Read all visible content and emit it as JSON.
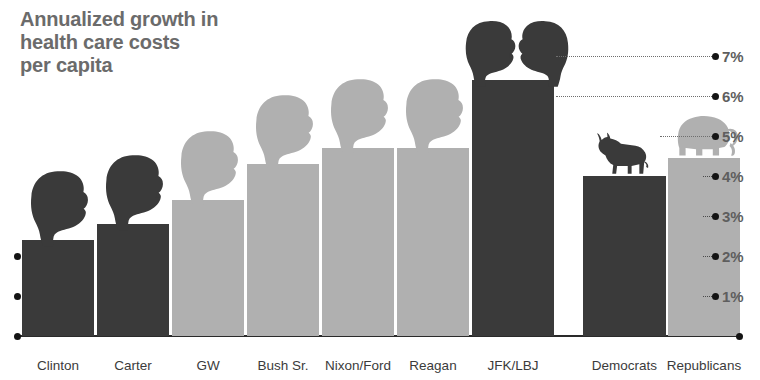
{
  "title": "Annualized growth in\nhealth care costs\nper capita",
  "colors": {
    "dark_bar": "#3a3a3a",
    "light_bar": "#b0b0b0",
    "title_text": "#6b6b6b",
    "axis": "#141414",
    "label_text": "#3b3b3b",
    "tick_text": "#5e5e5e"
  },
  "axis": {
    "tick_labels": [
      "1%",
      "2%",
      "3%",
      "4%",
      "5%",
      "6%",
      "7%"
    ],
    "tick_values": [
      1,
      2,
      3,
      4,
      5,
      6,
      7
    ],
    "left_tick_labels": [
      "",
      "",
      ""
    ],
    "position": "right"
  },
  "icons": {
    "democrat": "donkey-icon",
    "republican": "elephant-icon",
    "presidents": "head-silhouette-icon"
  },
  "chart_data": {
    "type": "bar",
    "title": "Annualized growth in health care costs per capita",
    "xlabel": "",
    "ylabel": "",
    "ylim": [
      0,
      7.5
    ],
    "grid": false,
    "legend": "none",
    "categories": [
      "Clinton",
      "Carter",
      "GW",
      "Bush Sr.",
      "Nixon/Ford",
      "Reagan",
      "JFK/LBJ",
      "Democrats",
      "Republicans"
    ],
    "values": [
      2.4,
      2.8,
      3.4,
      4.3,
      4.7,
      4.7,
      6.4,
      4.0,
      4.45
    ],
    "series": [
      {
        "name": "Annualized growth in health care costs per capita",
        "values": [
          2.4,
          2.8,
          3.4,
          4.3,
          4.7,
          4.7,
          6.4,
          4.0,
          4.45
        ]
      }
    ],
    "bar_party": [
      "democrat",
      "democrat",
      "republican",
      "republican",
      "republican",
      "republican",
      "democrat",
      "democrat",
      "republican"
    ],
    "annotations": [
      {
        "label": "donkey over Democrats bar",
        "category": "Democrats"
      },
      {
        "label": "elephant over Republicans bar",
        "category": "Republicans"
      },
      {
        "label": "president head silhouettes over each president bar"
      }
    ]
  },
  "bars": [
    {
      "label": "Clinton",
      "value": 2.4,
      "tone": "dark",
      "x": 22,
      "w": 72,
      "heads": 1,
      "head_tone": "dark"
    },
    {
      "label": "Carter",
      "value": 2.8,
      "tone": "dark",
      "x": 97,
      "w": 72,
      "heads": 1,
      "head_tone": "dark"
    },
    {
      "label": "GW",
      "value": 3.4,
      "tone": "light",
      "x": 172,
      "w": 72,
      "heads": 1,
      "head_tone": "light"
    },
    {
      "label": "Bush Sr.",
      "value": 4.3,
      "tone": "light",
      "x": 247,
      "w": 72,
      "heads": 1,
      "head_tone": "light"
    },
    {
      "label": "Nixon/Ford",
      "value": 4.7,
      "tone": "light",
      "x": 322,
      "w": 72,
      "heads": 1,
      "head_tone": "light"
    },
    {
      "label": "Reagan",
      "value": 4.7,
      "tone": "light",
      "x": 397,
      "w": 72,
      "heads": 1,
      "head_tone": "light"
    },
    {
      "label": "JFK/LBJ",
      "value": 6.4,
      "tone": "dark",
      "x": 472,
      "w": 82,
      "heads": 2,
      "head_tone": "dark"
    },
    {
      "label": "Democrats",
      "value": 4.0,
      "tone": "dark",
      "x": 583,
      "w": 83,
      "heads": 0,
      "head_tone": "dark"
    },
    {
      "label": "Republicans",
      "value": 4.45,
      "tone": "light",
      "x": 668,
      "w": 72,
      "heads": 0,
      "head_tone": "light"
    }
  ]
}
